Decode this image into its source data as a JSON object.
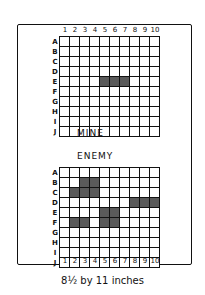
{
  "caption": "8½ by 11 inches",
  "boards": {
    "mine": {
      "title": "MINE",
      "columns": [
        "1",
        "2",
        "3",
        "4",
        "5",
        "6",
        "7",
        "8",
        "9",
        "10"
      ],
      "rows": [
        "A",
        "B",
        "C",
        "D",
        "E",
        "F",
        "G",
        "H",
        "I",
        "J"
      ],
      "shaded_cells": [
        "E5",
        "E6",
        "E7"
      ]
    },
    "enemy": {
      "title": "ENEMY",
      "columns": [
        "1",
        "2",
        "3",
        "4",
        "5",
        "6",
        "7",
        "8",
        "9",
        "10"
      ],
      "rows": [
        "A",
        "B",
        "C",
        "D",
        "E",
        "F",
        "G",
        "H",
        "I",
        "J"
      ],
      "shaded_cells": [
        "B3",
        "B4",
        "C2",
        "C3",
        "C4",
        "D8",
        "D9",
        "D10",
        "E5",
        "E6",
        "F2",
        "F3",
        "F5",
        "F6"
      ]
    }
  },
  "colors": {
    "ink": "#111111",
    "shade": "#5a5a5a",
    "paper": "#ffffff"
  }
}
